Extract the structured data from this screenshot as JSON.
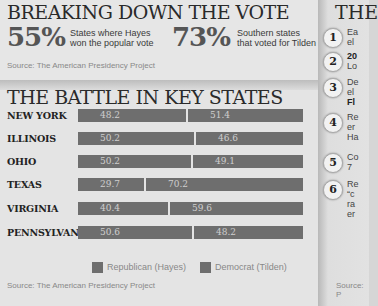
{
  "top": {
    "title": "BREAKING DOWN THE VOTE",
    "stat1": {
      "value": "55%",
      "label_line1": "States where Hayes",
      "label_line2": "won the popular vote"
    },
    "stat2": {
      "value": "73%",
      "label_line1": "Southern states",
      "label_line2": "that voted for Tilden"
    },
    "source": "Source: The American Presidency Project"
  },
  "battle": {
    "title": "THE BATTLE IN KEY STATES",
    "source": "Source: The American Presidency Project",
    "legend": {
      "republican": "Republican (Hayes)",
      "democrat": "Democrat (Tilden)"
    }
  },
  "right": {
    "title": "THE",
    "items": [
      {
        "num": "1",
        "line1": "Ea",
        "line2": "el"
      },
      {
        "num": "2",
        "line1": "20",
        "line2": "Lo"
      },
      {
        "num": "3",
        "line1": "De",
        "line2": "el",
        "line3": "Fl"
      },
      {
        "num": "4",
        "line1": "Re",
        "line2": "er",
        "line3": "Ha"
      },
      {
        "num": "5",
        "line1": "Co",
        "line2": "7"
      },
      {
        "num": "6",
        "line1": "Re",
        "line2": "“c",
        "line3": "ra",
        "line4": "er"
      }
    ],
    "source": "Source: P"
  },
  "colors": {
    "republican": "#6e6e6e",
    "democrat": "#6e6e6e",
    "background": "#e4e4e4"
  },
  "chart_data": {
    "type": "bar",
    "title": "THE BATTLE IN KEY STATES",
    "orientation": "horizontal-stacked",
    "categories": [
      "NEW YORK",
      "ILLINOIS",
      "OHIO",
      "TEXAS",
      "VIRGINIA",
      "PENNSYLVANIA"
    ],
    "series": [
      {
        "name": "Republican (Hayes)",
        "values": [
          48.2,
          50.2,
          50.2,
          29.7,
          40.4,
          50.6
        ]
      },
      {
        "name": "Democrat (Tilden)",
        "values": [
          51.4,
          46.6,
          49.1,
          70.2,
          59.6,
          48.2
        ]
      }
    ],
    "xlabel": "",
    "ylabel": "",
    "legend_position": "bottom",
    "grid": false,
    "source": "Source: The American Presidency Project"
  }
}
